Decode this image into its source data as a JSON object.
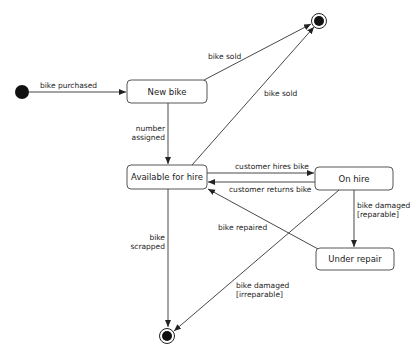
{
  "diagram": {
    "type": "state-machine",
    "states": [
      {
        "id": "new",
        "label": "New bike"
      },
      {
        "id": "available",
        "label": "Available for hire"
      },
      {
        "id": "onhire",
        "label": "On hire"
      },
      {
        "id": "repair",
        "label": "Under repair"
      }
    ],
    "pseudostates": [
      {
        "id": "initial",
        "kind": "initial"
      },
      {
        "id": "final_top",
        "kind": "final"
      },
      {
        "id": "final_bottom",
        "kind": "final"
      }
    ],
    "transitions": [
      {
        "from": "initial",
        "to": "new",
        "label": "bike purchased",
        "label_lines": [
          "bike purchased"
        ]
      },
      {
        "from": "new",
        "to": "final_top",
        "label": "bike sold",
        "label_lines": [
          "bike sold"
        ]
      },
      {
        "from": "new",
        "to": "available",
        "label": "number assigned",
        "label_lines": [
          "number",
          "assigned"
        ]
      },
      {
        "from": "available",
        "to": "final_top",
        "label": "bike sold",
        "label_lines": [
          "bike sold"
        ]
      },
      {
        "from": "available",
        "to": "onhire",
        "label": "customer hires bike",
        "label_lines": [
          "customer hires bike"
        ]
      },
      {
        "from": "onhire",
        "to": "available",
        "label": "customer returns bike",
        "label_lines": [
          "customer returns bike"
        ]
      },
      {
        "from": "onhire",
        "to": "repair",
        "label": "bike damaged [reparable]",
        "label_lines": [
          "bike damaged",
          "[reparable]"
        ]
      },
      {
        "from": "repair",
        "to": "available",
        "label": "bike repaired",
        "label_lines": [
          "bike repaired"
        ]
      },
      {
        "from": "available",
        "to": "final_bottom",
        "label": "bike scrapped",
        "label_lines": [
          "bike",
          "scrapped"
        ]
      },
      {
        "from": "onhire",
        "to": "final_bottom",
        "label": "bike damaged [irreparable]",
        "label_lines": [
          "bike damaged",
          "[irreparable]"
        ]
      }
    ]
  }
}
